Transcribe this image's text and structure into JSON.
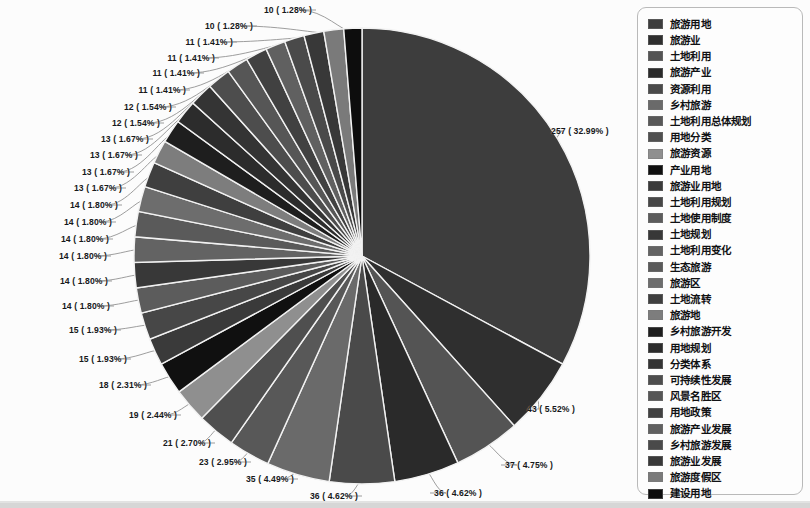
{
  "chart_data": {
    "type": "pie",
    "title": "",
    "subtitle": "",
    "xlabel": "",
    "ylabel": "",
    "legend_position": "right",
    "grid": false,
    "total": 779,
    "label_format": "count ( percent% )",
    "categories": [
      "旅游用地",
      "旅游业",
      "土地利用",
      "旅游产业",
      "资源利用",
      "乡村旅游",
      "土地利用总体规划",
      "用地分类",
      "旅游资源",
      "产业用地",
      "旅游业用地",
      "土地利用规划",
      "土地使用制度",
      "土地规划",
      "土地利用变化",
      "生态旅游",
      "旅游区",
      "土地流转",
      "旅游地",
      "乡村旅游开发",
      "用地规划",
      "分类体系",
      "可持续性发展",
      "风景名胜区",
      "用地政策",
      "旅游产业发展",
      "乡村旅游发展",
      "旅游业发展",
      "旅游度假区",
      "建设用地"
    ],
    "values": [
      257,
      43,
      37,
      36,
      36,
      35,
      23,
      21,
      19,
      18,
      15,
      15,
      14,
      14,
      14,
      14,
      14,
      14,
      13,
      13,
      13,
      13,
      13,
      12,
      12,
      11,
      11,
      11,
      11,
      10
    ],
    "percents": [
      32.99,
      5.52,
      4.75,
      4.62,
      4.62,
      4.49,
      2.95,
      2.7,
      2.44,
      2.31,
      1.93,
      1.93,
      1.8,
      1.8,
      1.8,
      1.8,
      1.8,
      1.8,
      1.67,
      1.67,
      1.67,
      1.67,
      1.67,
      1.54,
      1.54,
      1.41,
      1.41,
      1.41,
      1.41,
      1.28
    ],
    "data_labels": [
      "257 ( 32.99% )",
      "43 ( 5.52% )",
      "37 ( 4.75% )",
      "36 ( 4.62% )",
      "36 ( 4.62% )",
      "35 ( 4.49% )",
      "23 ( 2.95% )",
      "21 ( 2.70% )",
      "19 ( 2.44% )",
      "18 ( 2.31% )",
      "15 ( 1.93% )",
      "15 ( 1.93% )",
      "14 ( 1.80% )",
      "14 ( 1.80% )",
      "14 ( 1.80% )",
      "14 ( 1.80% )",
      "14 ( 1.80% )",
      "14 ( 1.80% )",
      "13 ( 1.67% )",
      "13 ( 1.67% )",
      "13 ( 1.67% )",
      "13 ( 1.67% )",
      "13 ( 1.67% )",
      "12 ( 1.54% )",
      "12 ( 1.54% )",
      "11 ( 1.41% )",
      "11 ( 1.41% )",
      "11 ( 1.41% )",
      "11 ( 1.41% )",
      "10 ( 1.28% )"
    ],
    "extra_data_labels": [
      "10 ( 1.28% )"
    ],
    "colors": [
      "#3d3d3d",
      "#2f2f2f",
      "#545454",
      "#2a2a2a",
      "#4a4a4a",
      "#6a6a6a",
      "#585858",
      "#4f4f4f",
      "#8f8f8f",
      "#101010",
      "#3a3a3a",
      "#474747",
      "#5c5c5c",
      "#383838",
      "#636363",
      "#5a5a5a",
      "#6d6d6d",
      "#3f3f3f",
      "#7d7d7d",
      "#1e1e1e",
      "#2c2c2c",
      "#343434",
      "#4d4d4d",
      "#565656",
      "#414141",
      "#606060",
      "#4a4a4a",
      "#383838",
      "#7a7a7a",
      "#0d0d0d"
    ]
  },
  "legend": {
    "items": [
      {
        "label": "旅游用地",
        "color": "#3d3d3d"
      },
      {
        "label": "旅游业",
        "color": "#2f2f2f"
      },
      {
        "label": "土地利用",
        "color": "#545454"
      },
      {
        "label": "旅游产业",
        "color": "#2a2a2a"
      },
      {
        "label": "资源利用",
        "color": "#4a4a4a"
      },
      {
        "label": "乡村旅游",
        "color": "#6a6a6a"
      },
      {
        "label": "土地利用总体规划",
        "color": "#585858"
      },
      {
        "label": "用地分类",
        "color": "#4f4f4f"
      },
      {
        "label": "旅游资源",
        "color": "#8f8f8f"
      },
      {
        "label": "产业用地",
        "color": "#101010"
      },
      {
        "label": "旅游业用地",
        "color": "#3a3a3a"
      },
      {
        "label": "土地利用规划",
        "color": "#474747"
      },
      {
        "label": "土地使用制度",
        "color": "#5c5c5c"
      },
      {
        "label": "土地规划",
        "color": "#383838"
      },
      {
        "label": "土地利用变化",
        "color": "#636363"
      },
      {
        "label": "生态旅游",
        "color": "#5a5a5a"
      },
      {
        "label": "旅游区",
        "color": "#6d6d6d"
      },
      {
        "label": "土地流转",
        "color": "#3f3f3f"
      },
      {
        "label": "旅游地",
        "color": "#7d7d7d"
      },
      {
        "label": "乡村旅游开发",
        "color": "#1e1e1e"
      },
      {
        "label": "用地规划",
        "color": "#2c2c2c"
      },
      {
        "label": "分类体系",
        "color": "#343434"
      },
      {
        "label": "可持续性发展",
        "color": "#4d4d4d"
      },
      {
        "label": "风景名胜区",
        "color": "#565656"
      },
      {
        "label": "用地政策",
        "color": "#414141"
      },
      {
        "label": "旅游产业发展",
        "color": "#606060"
      },
      {
        "label": "乡村旅游发展",
        "color": "#4a4a4a"
      },
      {
        "label": "旅游业发展",
        "color": "#383838"
      },
      {
        "label": "旅游度假区",
        "color": "#7a7a7a"
      },
      {
        "label": "建设用地",
        "color": "#0d0d0d"
      }
    ]
  },
  "labels_placed": [
    {
      "text": "10 ( 1.28% )",
      "x": 312,
      "y": 10,
      "align": "r"
    },
    {
      "text": "10 ( 1.28% )",
      "x": 253,
      "y": 26,
      "align": "r"
    },
    {
      "text": "11 ( 1.41% )",
      "x": 233,
      "y": 42,
      "align": "r"
    },
    {
      "text": "11 ( 1.41% )",
      "x": 215,
      "y": 58,
      "align": "r"
    },
    {
      "text": "11 ( 1.41% )",
      "x": 200,
      "y": 73,
      "align": "r"
    },
    {
      "text": "11 ( 1.41% )",
      "x": 186,
      "y": 90,
      "align": "r"
    },
    {
      "text": "12 ( 1.54% )",
      "x": 172,
      "y": 107,
      "align": "r"
    },
    {
      "text": "12 ( 1.54% )",
      "x": 160,
      "y": 123,
      "align": "r"
    },
    {
      "text": "13 ( 1.67% )",
      "x": 149,
      "y": 139,
      "align": "r"
    },
    {
      "text": "13 ( 1.67% )",
      "x": 138,
      "y": 155,
      "align": "r"
    },
    {
      "text": "13 ( 1.67% )",
      "x": 130,
      "y": 172,
      "align": "r"
    },
    {
      "text": "13 ( 1.67% )",
      "x": 122,
      "y": 188,
      "align": "r"
    },
    {
      "text": "14 ( 1.80% )",
      "x": 118,
      "y": 205,
      "align": "r"
    },
    {
      "text": "14 ( 1.80% )",
      "x": 112,
      "y": 222,
      "align": "r"
    },
    {
      "text": "14 ( 1.80% )",
      "x": 109,
      "y": 239,
      "align": "r"
    },
    {
      "text": "14 ( 1.80% )",
      "x": 107,
      "y": 256,
      "align": "r"
    },
    {
      "text": "14 ( 1.80% )",
      "x": 108,
      "y": 281,
      "align": "r"
    },
    {
      "text": "14 ( 1.80% )",
      "x": 110,
      "y": 306,
      "align": "r"
    },
    {
      "text": "15 ( 1.93% )",
      "x": 117,
      "y": 330,
      "align": "r"
    },
    {
      "text": "15 ( 1.93% )",
      "x": 127,
      "y": 359,
      "align": "r"
    },
    {
      "text": "18 ( 2.31% )",
      "x": 147,
      "y": 385,
      "align": "r"
    },
    {
      "text": "19 ( 2.44% )",
      "x": 177,
      "y": 415,
      "align": "r"
    },
    {
      "text": "21 ( 2.70% )",
      "x": 211,
      "y": 443,
      "align": "r"
    },
    {
      "text": "23 ( 2.95% )",
      "x": 247,
      "y": 462,
      "align": "r"
    },
    {
      "text": "35 ( 4.49% )",
      "x": 294,
      "y": 479,
      "align": "r"
    },
    {
      "text": "36 ( 4.62% )",
      "x": 358,
      "y": 496,
      "align": "r"
    },
    {
      "text": "36 ( 4.62% )",
      "x": 434,
      "y": 493,
      "align": "l"
    },
    {
      "text": "37 ( 4.75% )",
      "x": 505,
      "y": 465,
      "align": "l"
    },
    {
      "text": "43 ( 5.52% )",
      "x": 527,
      "y": 409,
      "align": "l"
    },
    {
      "text": "257 ( 32.99% )",
      "x": 551,
      "y": 131,
      "align": "l"
    }
  ]
}
